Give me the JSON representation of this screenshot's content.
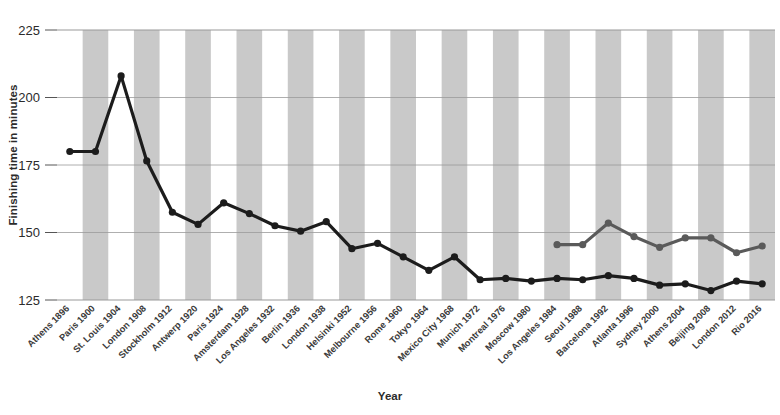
{
  "chart_data": {
    "type": "line",
    "title": "",
    "xlabel": "Year",
    "ylabel": "Finishing time in minutes",
    "ylim": [
      125,
      225
    ],
    "yticks": [
      125,
      150,
      175,
      200,
      225
    ],
    "grid": true,
    "legend": "none",
    "band_shading": "alternating vertical gray bands",
    "categories": [
      "Athens 1896",
      "Paris 1900",
      "St. Louis 1904",
      "London 1908",
      "Stockholm 1912",
      "Antwerp 1920",
      "Paris 1924",
      "Amsterdam 1928",
      "Los Angeles 1932",
      "Berlin 1936",
      "London 1938",
      "Helsinki 1952",
      "Melbourne 1956",
      "Rome 1960",
      "Tokyo 1964",
      "Mexico City 1968",
      "Munich 1972",
      "Montreal 1976",
      "Moscow 1980",
      "Los Angeles 1984",
      "Seoul 1988",
      "Barcelona 1992",
      "Atlanta 1996",
      "Sydney 2000",
      "Athens 2004",
      "Beijing 2008",
      "London 2012",
      "Rio 2016"
    ],
    "series": [
      {
        "name": "men",
        "color": "#1c1c1c",
        "values": [
          180,
          180,
          208,
          176.5,
          157.5,
          153,
          161,
          157,
          152.5,
          150.5,
          154,
          144,
          146,
          141,
          136,
          141,
          132.5,
          133,
          132,
          133,
          132.5,
          134,
          133,
          130.5,
          131,
          128.5,
          132,
          131
        ]
      },
      {
        "name": "women",
        "color": "#5a5a5a",
        "start_category": "Los Angeles 1984",
        "values": [
          null,
          null,
          null,
          null,
          null,
          null,
          null,
          null,
          null,
          null,
          null,
          null,
          null,
          null,
          null,
          null,
          null,
          null,
          null,
          145.5,
          145.5,
          153.5,
          148.5,
          144.5,
          148,
          148,
          142.5,
          145
        ]
      }
    ]
  },
  "axis": {
    "y_title": "Finishing time in minutes",
    "x_title": "Year"
  }
}
